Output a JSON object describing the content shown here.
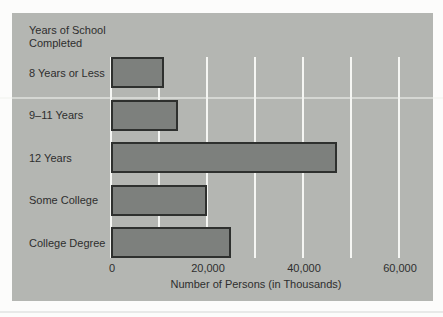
{
  "colors": {
    "page_bg": "#fcfcfb",
    "panel_bg": "#b4b6b2",
    "bar_fill": "#7d807d",
    "bar_border": "#2e302e",
    "gridline": "#f5f6f3",
    "text": "#2e2e2e"
  },
  "chart_data": {
    "type": "bar",
    "orientation": "horizontal",
    "title": "Years of School Completed",
    "categories": [
      "8 Years or Less",
      "9–11 Years",
      "12 Years",
      "Some College",
      "College Degree"
    ],
    "values": [
      11000,
      14000,
      47000,
      20000,
      25000
    ],
    "xlabel": "Number of Persons (in Thousands)",
    "ylabel": "Years of School Completed",
    "xlim": [
      0,
      60000
    ],
    "xticks": [
      0,
      20000,
      40000,
      60000
    ],
    "xtick_labels": [
      "0",
      "20,000",
      "40,000",
      "60,000"
    ],
    "gridline_interval": 10000,
    "grid": true,
    "gridline_color": "white",
    "legend": false
  }
}
